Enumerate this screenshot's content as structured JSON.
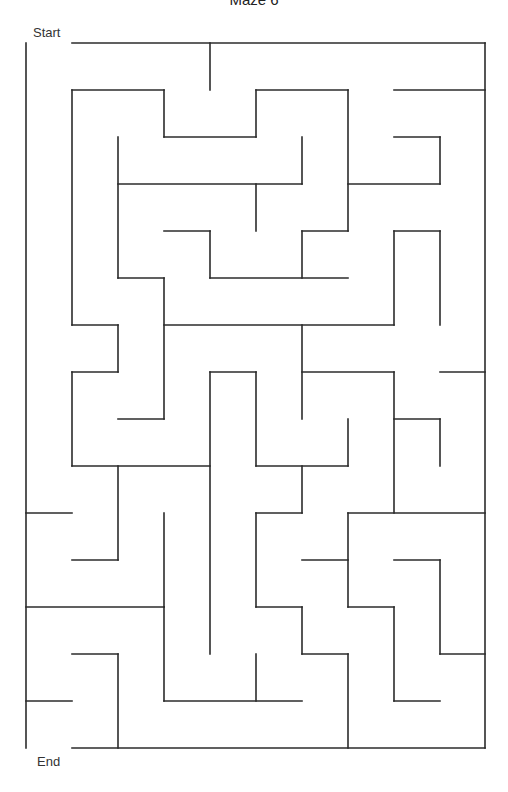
{
  "title": "Maze 6",
  "labels": {
    "start": "Start",
    "end": "End"
  },
  "colors": {
    "wall": "#2b2b2b",
    "background": "#ffffff",
    "text": "#333333"
  },
  "grid": {
    "cols": [
      26,
      72,
      118,
      164,
      210,
      256,
      302,
      348,
      394,
      440,
      485
    ],
    "rows": [
      43,
      90,
      137,
      184,
      231,
      278,
      325,
      372,
      419,
      466,
      513,
      560,
      607,
      654,
      701,
      748
    ]
  },
  "walls": [
    [
      72,
      43,
      485,
      43
    ],
    [
      26,
      43,
      26,
      748
    ],
    [
      485,
      43,
      485,
      748
    ],
    [
      72,
      748,
      485,
      748
    ],
    [
      210,
      43,
      210,
      90
    ],
    [
      72,
      90,
      164,
      90
    ],
    [
      164,
      90,
      164,
      137
    ],
    [
      164,
      137,
      256,
      137
    ],
    [
      256,
      90,
      256,
      137
    ],
    [
      256,
      90,
      348,
      90
    ],
    [
      348,
      90,
      348,
      231
    ],
    [
      394,
      90,
      485,
      90
    ],
    [
      394,
      137,
      440,
      137
    ],
    [
      440,
      137,
      440,
      184
    ],
    [
      348,
      184,
      440,
      184
    ],
    [
      72,
      90,
      72,
      325
    ],
    [
      118,
      137,
      118,
      278
    ],
    [
      118,
      184,
      302,
      184
    ],
    [
      302,
      137,
      302,
      184
    ],
    [
      256,
      184,
      256,
      231
    ],
    [
      164,
      231,
      210,
      231
    ],
    [
      210,
      231,
      210,
      278
    ],
    [
      210,
      278,
      348,
      278
    ],
    [
      302,
      231,
      348,
      231
    ],
    [
      302,
      231,
      302,
      278
    ],
    [
      118,
      278,
      164,
      278
    ],
    [
      164,
      278,
      164,
      419
    ],
    [
      72,
      325,
      118,
      325
    ],
    [
      118,
      325,
      118,
      372
    ],
    [
      72,
      372,
      118,
      372
    ],
    [
      72,
      372,
      72,
      466
    ],
    [
      118,
      419,
      164,
      419
    ],
    [
      164,
      325,
      394,
      325
    ],
    [
      394,
      231,
      440,
      231
    ],
    [
      394,
      231,
      394,
      325
    ],
    [
      440,
      231,
      440,
      325
    ],
    [
      302,
      325,
      302,
      419
    ],
    [
      302,
      372,
      394,
      372
    ],
    [
      394,
      372,
      394,
      513
    ],
    [
      440,
      372,
      485,
      372
    ],
    [
      394,
      419,
      440,
      419
    ],
    [
      440,
      419,
      440,
      466
    ],
    [
      72,
      466,
      210,
      466
    ],
    [
      210,
      372,
      256,
      372
    ],
    [
      210,
      372,
      210,
      654
    ],
    [
      256,
      372,
      256,
      466
    ],
    [
      256,
      466,
      348,
      466
    ],
    [
      348,
      419,
      348,
      466
    ],
    [
      302,
      466,
      302,
      513
    ],
    [
      256,
      513,
      302,
      513
    ],
    [
      256,
      513,
      256,
      607
    ],
    [
      256,
      607,
      302,
      607
    ],
    [
      302,
      607,
      302,
      654
    ],
    [
      348,
      513,
      485,
      513
    ],
    [
      348,
      513,
      348,
      607
    ],
    [
      302,
      560,
      348,
      560
    ],
    [
      348,
      607,
      394,
      607
    ],
    [
      394,
      607,
      394,
      701
    ],
    [
      394,
      560,
      440,
      560
    ],
    [
      440,
      560,
      440,
      654
    ],
    [
      440,
      654,
      485,
      654
    ],
    [
      394,
      701,
      440,
      701
    ],
    [
      302,
      654,
      348,
      654
    ],
    [
      348,
      654,
      348,
      748
    ],
    [
      26,
      513,
      72,
      513
    ],
    [
      118,
      466,
      118,
      560
    ],
    [
      72,
      560,
      118,
      560
    ],
    [
      164,
      513,
      164,
      607
    ],
    [
      26,
      607,
      164,
      607
    ],
    [
      164,
      607,
      164,
      701
    ],
    [
      164,
      701,
      302,
      701
    ],
    [
      256,
      654,
      256,
      701
    ],
    [
      72,
      654,
      118,
      654
    ],
    [
      118,
      654,
      118,
      748
    ],
    [
      26,
      701,
      72,
      701
    ]
  ]
}
